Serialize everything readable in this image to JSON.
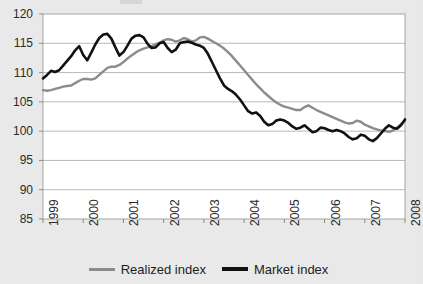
{
  "chart_data": {
    "type": "line",
    "title": "",
    "xlabel": "",
    "ylabel": "",
    "ylim": [
      85,
      120
    ],
    "ytick_values": [
      85,
      90,
      95,
      100,
      105,
      110,
      115,
      120
    ],
    "ytick_labels": [
      "85",
      "90",
      "95",
      "100",
      "105",
      "110",
      "115",
      "120"
    ],
    "xlim": [
      1999,
      2008
    ],
    "xtick_values": [
      1999,
      2000,
      2001,
      2002,
      2003,
      2004,
      2005,
      2006,
      2007,
      2008
    ],
    "xtick_labels": [
      "1999",
      "2000",
      "2001",
      "2002",
      "2003",
      "2004",
      "2005",
      "2006",
      "2007",
      "2008"
    ],
    "grid": "horizontal",
    "legend_position": "bottom-center",
    "series": [
      {
        "name": "Realized index",
        "color": "#8c8c8c",
        "x": [
          1999.0,
          1999.1,
          1999.2,
          1999.3,
          1999.4,
          1999.5,
          1999.6,
          1999.7,
          1999.8,
          1999.9,
          2000.0,
          2000.1,
          2000.2,
          2000.3,
          2000.4,
          2000.5,
          2000.6,
          2000.7,
          2000.8,
          2000.9,
          2001.0,
          2001.1,
          2001.2,
          2001.3,
          2001.4,
          2001.5,
          2001.6,
          2001.7,
          2001.8,
          2001.9,
          2002.0,
          2002.1,
          2002.2,
          2002.3,
          2002.4,
          2002.5,
          2002.6,
          2002.7,
          2002.8,
          2002.9,
          2003.0,
          2003.1,
          2003.2,
          2003.3,
          2003.4,
          2003.5,
          2003.6,
          2003.7,
          2003.8,
          2003.9,
          2004.0,
          2004.1,
          2004.2,
          2004.3,
          2004.4,
          2004.5,
          2004.6,
          2004.7,
          2004.8,
          2004.9,
          2005.0,
          2005.1,
          2005.2,
          2005.3,
          2005.4,
          2005.5,
          2005.6,
          2005.7,
          2005.8,
          2005.9,
          2006.0,
          2006.1,
          2006.2,
          2006.3,
          2006.4,
          2006.5,
          2006.6,
          2006.7,
          2006.8,
          2006.9,
          2007.0,
          2007.1,
          2007.2,
          2007.3,
          2007.4,
          2007.5,
          2007.6,
          2007.7,
          2007.8,
          2007.9,
          2008.0
        ],
        "values": [
          107.0,
          106.9,
          107.0,
          107.2,
          107.4,
          107.6,
          107.7,
          107.8,
          108.2,
          108.6,
          108.9,
          108.9,
          108.8,
          109.0,
          109.6,
          110.2,
          110.8,
          111.0,
          111.0,
          111.3,
          111.8,
          112.4,
          112.9,
          113.4,
          113.8,
          114.1,
          114.3,
          114.5,
          114.8,
          115.1,
          115.5,
          115.7,
          115.6,
          115.3,
          115.5,
          115.9,
          115.7,
          115.3,
          115.5,
          116.0,
          116.1,
          115.8,
          115.4,
          115.0,
          114.6,
          114.1,
          113.5,
          112.8,
          112.0,
          111.2,
          110.4,
          109.6,
          108.8,
          108.0,
          107.3,
          106.6,
          106.0,
          105.4,
          104.9,
          104.5,
          104.2,
          104.0,
          103.8,
          103.6,
          103.6,
          104.1,
          104.4,
          104.0,
          103.6,
          103.3,
          103.0,
          102.7,
          102.4,
          102.1,
          101.8,
          101.5,
          101.3,
          101.4,
          101.8,
          101.6,
          101.1,
          100.8,
          100.5,
          100.3,
          100.1,
          100.0,
          99.9,
          100.1,
          100.6,
          101.2,
          101.8
        ]
      },
      {
        "name": "Market index",
        "color": "#111111",
        "x": [
          1999.0,
          1999.1,
          1999.2,
          1999.3,
          1999.4,
          1999.5,
          1999.6,
          1999.7,
          1999.8,
          1999.9,
          2000.0,
          2000.1,
          2000.2,
          2000.3,
          2000.4,
          2000.5,
          2000.6,
          2000.7,
          2000.8,
          2000.9,
          2001.0,
          2001.1,
          2001.2,
          2001.3,
          2001.4,
          2001.5,
          2001.6,
          2001.7,
          2001.8,
          2001.9,
          2002.0,
          2002.1,
          2002.2,
          2002.3,
          2002.4,
          2002.5,
          2002.6,
          2002.7,
          2002.8,
          2002.9,
          2003.0,
          2003.1,
          2003.2,
          2003.3,
          2003.4,
          2003.5,
          2003.6,
          2003.7,
          2003.8,
          2003.9,
          2004.0,
          2004.1,
          2004.2,
          2004.3,
          2004.4,
          2004.5,
          2004.6,
          2004.7,
          2004.8,
          2004.9,
          2005.0,
          2005.1,
          2005.2,
          2005.3,
          2005.4,
          2005.5,
          2005.6,
          2005.7,
          2005.8,
          2005.9,
          2006.0,
          2006.1,
          2006.2,
          2006.3,
          2006.4,
          2006.5,
          2006.6,
          2006.7,
          2006.8,
          2006.9,
          2007.0,
          2007.1,
          2007.2,
          2007.3,
          2007.4,
          2007.5,
          2007.6,
          2007.7,
          2007.8,
          2007.9,
          2008.0
        ],
        "values": [
          109.0,
          109.6,
          110.3,
          110.1,
          110.4,
          111.2,
          112.0,
          112.8,
          113.8,
          114.5,
          113.0,
          112.1,
          113.4,
          114.8,
          115.9,
          116.5,
          116.6,
          115.8,
          114.3,
          112.9,
          113.5,
          114.6,
          115.8,
          116.3,
          116.4,
          116.0,
          114.9,
          114.2,
          114.3,
          115.0,
          115.2,
          114.2,
          113.5,
          113.9,
          115.0,
          115.2,
          115.3,
          115.1,
          114.8,
          114.6,
          114.2,
          113.2,
          111.8,
          110.4,
          109.0,
          107.8,
          107.2,
          106.8,
          106.2,
          105.4,
          104.4,
          103.4,
          103.0,
          103.2,
          102.6,
          101.6,
          101.0,
          101.2,
          101.8,
          102.0,
          101.8,
          101.4,
          100.8,
          100.4,
          100.6,
          101.0,
          100.4,
          99.8,
          100.0,
          100.6,
          100.5,
          100.2,
          100.0,
          100.2,
          100.0,
          99.6,
          99.0,
          98.6,
          98.8,
          99.4,
          99.2,
          98.6,
          98.3,
          98.8,
          99.6,
          100.4,
          101.0,
          100.6,
          100.4,
          101.0,
          102.0
        ]
      }
    ]
  },
  "legend": {
    "realized_label": "Realized index",
    "market_label": "Market index"
  },
  "colors": {
    "realized": "#8c8c8c",
    "market": "#111111",
    "plot_background": "#ffffff",
    "figure_background": "#e9e9e9",
    "grid": "#b9b9b9",
    "axis": "#8a8a8a",
    "text": "#2b2b2b"
  }
}
